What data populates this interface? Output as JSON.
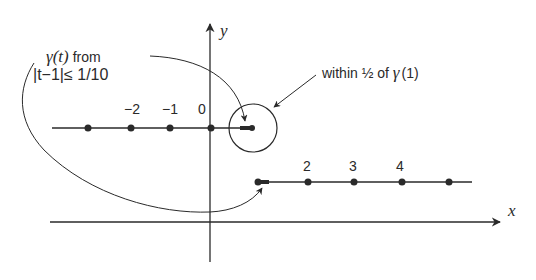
{
  "axes": {
    "x_label": "x",
    "y_label": "y"
  },
  "upper_segment": {
    "tick_labels": [
      "−2",
      "−1",
      "0"
    ]
  },
  "lower_segment": {
    "tick_labels": [
      "2",
      "3",
      "4"
    ]
  },
  "annotations": {
    "gamma_label_line1_gamma": "γ(t)",
    "gamma_label_line1_rest": " from",
    "gamma_label_line2": "|t−1|≤ 1/10",
    "circle_label_text": "within ½ of ",
    "circle_label_gamma": "γ",
    "circle_label_arg": "(1)"
  },
  "colors": {
    "ink": "#2a2a2a",
    "background": "#ffffff"
  }
}
